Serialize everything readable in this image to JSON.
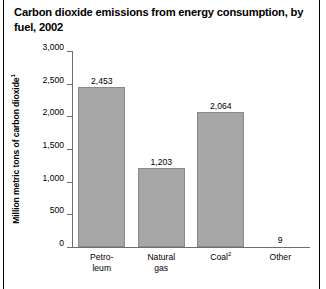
{
  "chart_data": {
    "type": "bar",
    "title": "Carbon dioxide emissions from energy consumption, by fuel, 2002",
    "xlabel": "",
    "ylabel": "Million metric tons of carbon dioxide",
    "ylabel_footnote": "1",
    "categories": [
      "Petro-\nleum",
      "Natural\ngas",
      "Coal",
      "Other"
    ],
    "category_footnotes": [
      "",
      "",
      "2",
      ""
    ],
    "values": [
      2453,
      1203,
      2064,
      9
    ],
    "value_labels": [
      "2,453",
      "1,203",
      "2,064",
      "9"
    ],
    "ylim": [
      0,
      3000
    ],
    "ytick_values": [
      3000,
      2500,
      2000,
      1500,
      1000,
      500,
      0
    ],
    "ytick_labels": [
      "3,000",
      "2,500",
      "2,000",
      "1,500",
      "1,000",
      "500",
      "0"
    ],
    "grid": false,
    "legend": false,
    "bar_color": "#a6a6a6",
    "bar_edge_color": "#8a8a8a",
    "axis_color": "#6e6e6e",
    "text_color": "#000000",
    "background_color": "#ffffff"
  }
}
